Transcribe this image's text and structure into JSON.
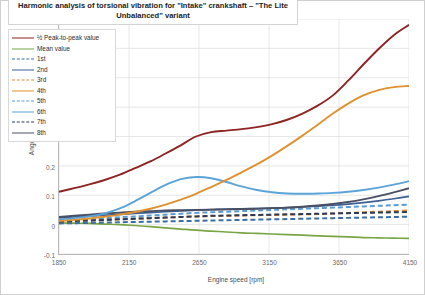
{
  "chart": {
    "title": "Harmonic analysis of torsional vibration for \"Intake\" crankshaft – \"The Lite Unbalanced\" variant",
    "xlabel": "Engine speed [rpm]",
    "ylabel": "Angular displacement [deg]"
  },
  "axes": {
    "yticks": [
      "0.7",
      "0.6",
      "0.5",
      "0.4",
      "0.3",
      "0.2",
      "0.1",
      "0",
      "-0.1"
    ],
    "xticks": [
      "1850",
      "2150",
      "2650",
      "3150",
      "3650",
      "4150"
    ]
  },
  "legend": {
    "items": [
      {
        "label": "½ Peak-to-peak value",
        "color": "#8e2323",
        "dash": "solid",
        "width": 1.8
      },
      {
        "label": "Mean value",
        "color": "#7aa547",
        "dash": "solid",
        "width": 1.4
      },
      {
        "label": "1st",
        "color": "#3b6ea5",
        "dash": "dashed",
        "width": 1.6
      },
      {
        "label": "2nd",
        "color": "#3b5f93",
        "dash": "solid",
        "width": 1.6
      },
      {
        "label": "3rd",
        "color": "#dd8a3d",
        "dash": "dashed",
        "width": 1.6
      },
      {
        "label": "4th",
        "color": "#e0912f",
        "dash": "solid",
        "width": 1.8
      },
      {
        "label": "5th",
        "color": "#5a9bd5",
        "dash": "dashed",
        "width": 1.6
      },
      {
        "label": "6th",
        "color": "#5ba4d8",
        "dash": "solid",
        "width": 1.8
      },
      {
        "label": "7th",
        "color": "#2b3a56",
        "dash": "dashed",
        "width": 1.6
      },
      {
        "label": "8th",
        "color": "#4a4f63",
        "dash": "solid",
        "width": 1.8
      }
    ]
  },
  "chart_data": {
    "type": "line",
    "title": "Harmonic analysis of torsional vibration for \"Intake\" crankshaft – \"The Lite Unbalanced\" variant",
    "xlabel": "Engine speed [rpm]",
    "ylabel": "Angular displacement [deg]",
    "xlim": [
      1850,
      4150
    ],
    "ylim": [
      -0.1,
      0.7
    ],
    "grid": true,
    "legend_position": "top-left",
    "x": [
      1850,
      1950,
      2050,
      2150,
      2250,
      2350,
      2450,
      2550,
      2650,
      2750,
      2850,
      2950,
      3050,
      3150,
      3250,
      3350,
      3450,
      3550,
      3650,
      3750,
      3850,
      3950,
      4050,
      4150
    ],
    "series": [
      {
        "name": "½ Peak-to-peak value",
        "color": "#8e2323",
        "dash": "solid",
        "values": [
          0.112,
          0.124,
          0.137,
          0.152,
          0.17,
          0.192,
          0.215,
          0.242,
          0.27,
          0.3,
          0.315,
          0.32,
          0.325,
          0.332,
          0.342,
          0.357,
          0.378,
          0.405,
          0.44,
          0.49,
          0.545,
          0.598,
          0.645,
          0.68
        ]
      },
      {
        "name": "Mean value",
        "color": "#7aa547",
        "dash": "solid",
        "values": [
          0.006,
          0.005,
          0.004,
          0.002,
          0.0,
          -0.003,
          -0.007,
          -0.011,
          -0.015,
          -0.019,
          -0.022,
          -0.025,
          -0.028,
          -0.03,
          -0.032,
          -0.034,
          -0.036,
          -0.038,
          -0.04,
          -0.042,
          -0.044,
          -0.045,
          -0.046,
          -0.047
        ]
      },
      {
        "name": "1st",
        "color": "#3b6ea5",
        "dash": "dashed",
        "values": [
          0.004,
          0.005,
          0.006,
          0.007,
          0.008,
          0.009,
          0.01,
          0.011,
          0.012,
          0.013,
          0.014,
          0.015,
          0.016,
          0.017,
          0.018,
          0.019,
          0.02,
          0.021,
          0.022,
          0.023,
          0.024,
          0.025,
          0.026,
          0.027
        ]
      },
      {
        "name": "2nd",
        "color": "#3b5f93",
        "dash": "solid",
        "values": [
          0.023,
          0.026,
          0.029,
          0.032,
          0.035,
          0.038,
          0.041,
          0.044,
          0.047,
          0.049,
          0.051,
          0.053,
          0.054,
          0.055,
          0.056,
          0.058,
          0.06,
          0.063,
          0.066,
          0.07,
          0.075,
          0.081,
          0.088,
          0.096
        ]
      },
      {
        "name": "3rd",
        "color": "#dd8a3d",
        "dash": "dashed",
        "values": [
          0.01,
          0.012,
          0.014,
          0.016,
          0.018,
          0.02,
          0.022,
          0.024,
          0.026,
          0.028,
          0.029,
          0.03,
          0.031,
          0.032,
          0.033,
          0.034,
          0.035,
          0.036,
          0.038,
          0.04,
          0.042,
          0.044,
          0.046,
          0.048
        ]
      },
      {
        "name": "4th",
        "color": "#e0912f",
        "dash": "solid",
        "values": [
          0.012,
          0.016,
          0.021,
          0.027,
          0.034,
          0.043,
          0.054,
          0.068,
          0.085,
          0.105,
          0.128,
          0.152,
          0.178,
          0.205,
          0.235,
          0.268,
          0.303,
          0.34,
          0.378,
          0.412,
          0.44,
          0.458,
          0.468,
          0.472
        ]
      },
      {
        "name": "5th",
        "color": "#5a9bd5",
        "dash": "dashed",
        "values": [
          0.014,
          0.016,
          0.019,
          0.022,
          0.025,
          0.028,
          0.031,
          0.034,
          0.037,
          0.04,
          0.042,
          0.044,
          0.046,
          0.048,
          0.05,
          0.052,
          0.054,
          0.056,
          0.058,
          0.06,
          0.062,
          0.064,
          0.066,
          0.068
        ]
      },
      {
        "name": "6th",
        "color": "#5ba4d8",
        "dash": "solid",
        "values": [
          0.018,
          0.022,
          0.028,
          0.038,
          0.055,
          0.08,
          0.108,
          0.135,
          0.155,
          0.162,
          0.158,
          0.145,
          0.13,
          0.118,
          0.11,
          0.106,
          0.105,
          0.106,
          0.108,
          0.112,
          0.118,
          0.126,
          0.136,
          0.148
        ]
      },
      {
        "name": "7th",
        "color": "#2b3a56",
        "dash": "dashed",
        "values": [
          0.01,
          0.012,
          0.014,
          0.016,
          0.018,
          0.02,
          0.022,
          0.024,
          0.026,
          0.028,
          0.03,
          0.031,
          0.032,
          0.033,
          0.034,
          0.035,
          0.036,
          0.037,
          0.038,
          0.039,
          0.04,
          0.041,
          0.042,
          0.043
        ]
      },
      {
        "name": "8th",
        "color": "#4a4f63",
        "dash": "solid",
        "values": [
          0.026,
          0.03,
          0.034,
          0.038,
          0.041,
          0.044,
          0.046,
          0.048,
          0.049,
          0.05,
          0.051,
          0.052,
          0.053,
          0.054,
          0.056,
          0.058,
          0.061,
          0.065,
          0.07,
          0.077,
          0.086,
          0.097,
          0.11,
          0.124
        ]
      }
    ]
  }
}
